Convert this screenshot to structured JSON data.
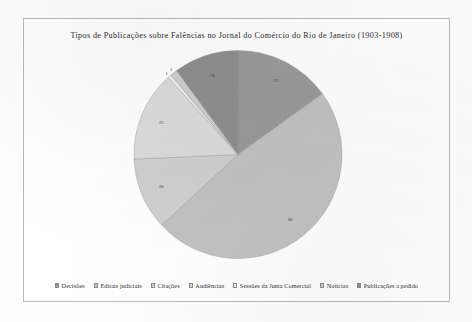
{
  "chart_data": {
    "type": "pie",
    "title": "Tipos de Publicações sobre Falências no Jornal do Comércio do Rio de Janeiro (1903-1908)",
    "categories": [
      "Decisões",
      "Editais judiciais",
      "Citações",
      "Audiências",
      "Sessões da Junta Comercial",
      "Notícias",
      "Publicações a pedido"
    ],
    "values": [
      27,
      86,
      20,
      25,
      1,
      2,
      18
    ],
    "labels": [
      "27",
      "86",
      "20",
      "25",
      "1",
      "2",
      "18"
    ],
    "colors": [
      "#9a9a9a",
      "#c2c2c2",
      "#d0d0d0",
      "#dcdcdc",
      "#efefef",
      "#cfcfcf",
      "#8f8f8f"
    ],
    "legend_position": "bottom",
    "grid": false,
    "xlabel": "",
    "ylabel": ""
  },
  "legend": {
    "items": [
      {
        "label": "Decisões",
        "color": "#9a9a9a"
      },
      {
        "label": "Editais judiciais",
        "color": "#c2c2c2"
      },
      {
        "label": "Citações",
        "color": "#d0d0d0"
      },
      {
        "label": "Audiências",
        "color": "#dcdcdc"
      },
      {
        "label": "Sessões da Junta Comercial",
        "color": "#efefef"
      },
      {
        "label": "Notícias",
        "color": "#cfcfcf"
      },
      {
        "label": "Publicações a pedido",
        "color": "#8f8f8f"
      }
    ]
  }
}
